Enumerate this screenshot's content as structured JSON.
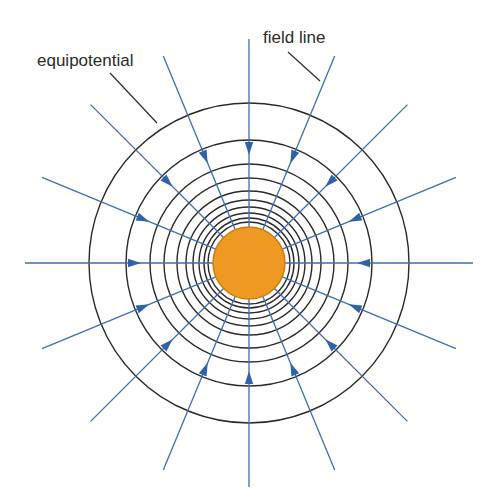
{
  "diagram": {
    "type": "radial-field",
    "center": {
      "x": 249,
      "y": 263
    },
    "colors": {
      "background": "#ffffff",
      "charge_fill": "#EE9A22",
      "charge_stroke": "#C97D16",
      "equipotential": "#2a2a2a",
      "field_line": "#3E6FAE",
      "arrow": "#2F62A6",
      "leader": "#2b2b2b"
    },
    "charge": {
      "radius": 36
    },
    "equipotentials": {
      "radii": [
        160,
        123,
        99,
        85,
        72,
        63,
        56,
        50,
        45,
        41
      ]
    },
    "field_lines": {
      "count": 16,
      "angle_step_deg": 22.5,
      "outer_radius": 224,
      "inner_radius": 36,
      "arrow_radius": 114,
      "direction": "inward"
    },
    "labels": {
      "equipotential": {
        "text": "equipotential",
        "x": 37,
        "y": 66,
        "leader": {
          "x1": 110,
          "y1": 73,
          "x2": 157,
          "y2": 123
        }
      },
      "field_line": {
        "text": "field line",
        "x": 263,
        "y": 43,
        "leader": {
          "x1": 288,
          "y1": 52,
          "x2": 320,
          "y2": 81
        }
      }
    }
  }
}
